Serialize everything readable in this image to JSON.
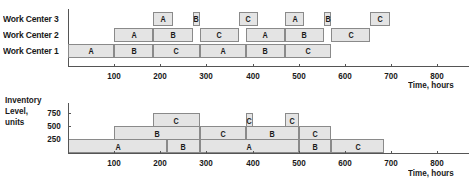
{
  "chart_data": [
    {
      "type": "gantt",
      "title": "",
      "xlabel": "Time, hours",
      "ylabel": "",
      "xlim": [
        0,
        870
      ],
      "x_ticks": [
        100,
        200,
        300,
        400,
        500,
        600,
        700,
        800
      ],
      "rows": [
        "Work Center 3",
        "Work Center 2",
        "Work Center 1"
      ],
      "tasks": [
        {
          "row": "Work Center 1",
          "label": "A",
          "start": 0,
          "end": 100
        },
        {
          "row": "Work Center 1",
          "label": "B",
          "start": 100,
          "end": 185
        },
        {
          "row": "Work Center 1",
          "label": "C",
          "start": 185,
          "end": 285
        },
        {
          "row": "Work Center 1",
          "label": "A",
          "start": 285,
          "end": 385
        },
        {
          "row": "Work Center 1",
          "label": "B",
          "start": 385,
          "end": 470
        },
        {
          "row": "Work Center 1",
          "label": "C",
          "start": 470,
          "end": 570
        },
        {
          "row": "Work Center 2",
          "label": "A",
          "start": 100,
          "end": 185
        },
        {
          "row": "Work Center 2",
          "label": "B",
          "start": 185,
          "end": 270
        },
        {
          "row": "Work Center 2",
          "label": "C",
          "start": 285,
          "end": 370
        },
        {
          "row": "Work Center 2",
          "label": "A",
          "start": 385,
          "end": 470
        },
        {
          "row": "Work Center 2",
          "label": "B",
          "start": 470,
          "end": 555
        },
        {
          "row": "Work Center 2",
          "label": "C",
          "start": 570,
          "end": 655
        },
        {
          "row": "Work Center 3",
          "label": "A",
          "start": 185,
          "end": 227
        },
        {
          "row": "Work Center 3",
          "label": "B",
          "start": 270,
          "end": 285
        },
        {
          "row": "Work Center 3",
          "label": "C",
          "start": 370,
          "end": 412
        },
        {
          "row": "Work Center 3",
          "label": "A",
          "start": 470,
          "end": 512
        },
        {
          "row": "Work Center 3",
          "label": "B",
          "start": 555,
          "end": 570
        },
        {
          "row": "Work Center 3",
          "label": "C",
          "start": 655,
          "end": 697
        }
      ]
    },
    {
      "type": "area",
      "title": "",
      "xlabel": "Time, hours",
      "ylabel": "Inventory Level, units",
      "xlim": [
        0,
        870
      ],
      "ylim": [
        0,
        900
      ],
      "x_ticks": [
        100,
        200,
        300,
        400,
        500,
        600,
        700,
        800
      ],
      "y_ticks": [
        250,
        500,
        750
      ],
      "segments": [
        {
          "label": "A",
          "layer": 1,
          "start": 0,
          "end": 215
        },
        {
          "label": "B",
          "layer": 1,
          "start": 215,
          "end": 285
        },
        {
          "label": "A",
          "layer": 1,
          "start": 285,
          "end": 500
        },
        {
          "label": "B",
          "layer": 1,
          "start": 500,
          "end": 570
        },
        {
          "label": "C",
          "layer": 1,
          "start": 570,
          "end": 685
        },
        {
          "label": "B",
          "layer": 2,
          "start": 100,
          "end": 285
        },
        {
          "label": "C",
          "layer": 2,
          "start": 285,
          "end": 385
        },
        {
          "label": "B",
          "layer": 2,
          "start": 385,
          "end": 500
        },
        {
          "label": "C",
          "layer": 2,
          "start": 500,
          "end": 570
        },
        {
          "label": "C",
          "layer": 3,
          "start": 185,
          "end": 285
        },
        {
          "label": "C",
          "layer": 3,
          "start": 385,
          "end": 400
        },
        {
          "label": "C",
          "layer": 3,
          "start": 470,
          "end": 500
        }
      ]
    }
  ],
  "top": {
    "rows": [
      "Work Center 3",
      "Work Center 2",
      "Work Center 1"
    ],
    "ticks": [
      "100",
      "200",
      "300",
      "400",
      "500",
      "600",
      "700",
      "800"
    ],
    "xlabel": "Time, hours"
  },
  "bottom": {
    "ylabel": [
      "Inventory",
      "Level,",
      "units"
    ],
    "yticks": [
      "750",
      "500",
      "250"
    ],
    "ticks": [
      "100",
      "200",
      "300",
      "400",
      "500",
      "600",
      "700",
      "800"
    ],
    "xlabel": "Time, hours"
  }
}
